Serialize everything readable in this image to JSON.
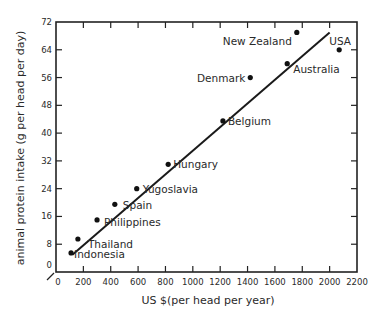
{
  "chart_data": {
    "type": "scatter",
    "title": "",
    "xlabel": "US $(per head per year)",
    "ylabel": "animal protein intake (g per head per day)",
    "xlim": [
      0,
      2200
    ],
    "ylim": [
      0,
      72
    ],
    "x_ticks": [
      0,
      200,
      400,
      600,
      800,
      1000,
      1200,
      1400,
      1600,
      1800,
      2000,
      2200
    ],
    "y_ticks": [
      0,
      8,
      16,
      24,
      32,
      40,
      48,
      56,
      64,
      72
    ],
    "grid": false,
    "legend": null,
    "points": [
      {
        "label": "Indonesia",
        "x": 110,
        "y": 5.5
      },
      {
        "label": "Thailand",
        "x": 160,
        "y": 9.5
      },
      {
        "label": "Philippines",
        "x": 300,
        "y": 15
      },
      {
        "label": "Spain",
        "x": 430,
        "y": 19.5
      },
      {
        "label": "Yugoslavia",
        "x": 590,
        "y": 24
      },
      {
        "label": "Hungary",
        "x": 820,
        "y": 31
      },
      {
        "label": "Belgium",
        "x": 1220,
        "y": 43.5
      },
      {
        "label": "Denmark",
        "x": 1420,
        "y": 56
      },
      {
        "label": "Australia",
        "x": 1690,
        "y": 60
      },
      {
        "label": "New Zealand",
        "x": 1760,
        "y": 69
      },
      {
        "label": "USA",
        "x": 2070,
        "y": 64
      }
    ],
    "trend_line": {
      "x": [
        120,
        2000
      ],
      "y": [
        5,
        69
      ]
    }
  },
  "labels": {
    "xlabel": "US $(per head per year)",
    "ylabel": "animal protein intake (g per head per day)"
  }
}
